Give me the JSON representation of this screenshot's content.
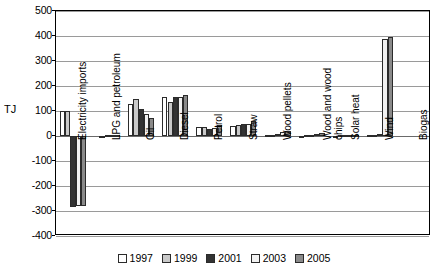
{
  "chart_data": {
    "type": "bar",
    "title": "",
    "subtitle": "",
    "xlabel": "",
    "ylabel": "TJ",
    "ylim": [
      -400,
      500
    ],
    "ytick_step": 100,
    "yticks": [
      500,
      400,
      300,
      200,
      100,
      0,
      -100,
      -200,
      -300,
      -400
    ],
    "ytick_labels": [
      "500",
      "400",
      "300",
      "200",
      "100",
      "0",
      "-100",
      "-200",
      "-300",
      "-400"
    ],
    "grid": true,
    "legend_position": "bottom",
    "orientation": "vertical",
    "categories": [
      "Electricity imports",
      "LPG and petroleum",
      "Oil",
      "Diesel",
      "Petrol",
      "Straw",
      "Wood pellets",
      "Wood and wood chips",
      "Solar heat",
      "Wind",
      "Biogas"
    ],
    "series": [
      {
        "name": "1997",
        "color": "#ffffff",
        "values": [
          100,
          0,
          130,
          155,
          38,
          40,
          3,
          2,
          2,
          4,
          0
        ]
      },
      {
        "name": "1999",
        "color": "#c9c9c9",
        "values": [
          100,
          2,
          148,
          138,
          38,
          44,
          5,
          3,
          3,
          5,
          0
        ]
      },
      {
        "name": "2001",
        "color": "#333333",
        "values": [
          -283,
          3,
          108,
          157,
          30,
          48,
          10,
          6,
          4,
          8,
          0
        ]
      },
      {
        "name": "2003",
        "color": "#f2f2f2",
        "values": [
          -278,
          3,
          88,
          157,
          33,
          50,
          18,
          10,
          4,
          388,
          0
        ]
      },
      {
        "name": "2005",
        "color": "#8a8a8a",
        "values": [
          -281,
          3,
          74,
          165,
          44,
          62,
          20,
          14,
          5,
          395,
          0
        ]
      }
    ]
  },
  "legend": {
    "items": [
      {
        "label": "1997"
      },
      {
        "label": "1999"
      },
      {
        "label": "2001"
      },
      {
        "label": "2003"
      },
      {
        "label": "2005"
      }
    ]
  }
}
